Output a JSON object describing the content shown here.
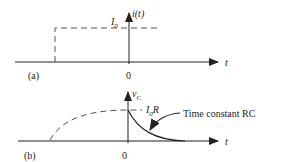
{
  "panel_a": {
    "label": "(a)",
    "y_label": "i(t)",
    "level_label": "I",
    "level_sub": "0",
    "origin": "0",
    "x_label": "t"
  },
  "panel_b": {
    "label": "(b)",
    "y_label": "v",
    "y_sub": "C",
    "level_label": "I",
    "level_sub": "0",
    "level_suffix": "R",
    "annotation": "Time constant RC",
    "origin": "0",
    "x_label": "t"
  },
  "colors": {
    "line": "#222222",
    "dash": "#555555"
  }
}
